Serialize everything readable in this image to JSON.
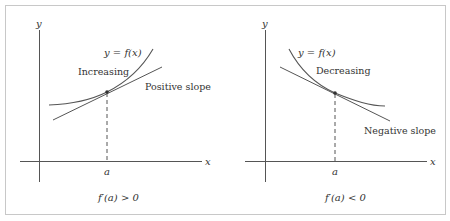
{
  "figure": {
    "left_panel": {
      "y_axis_label": "y",
      "x_axis_label": "x",
      "curve_label": "y = f(x)",
      "trend_label": "Increasing",
      "tangent_label": "Positive slope",
      "point_label": "a",
      "caption": "f′(a) > 0"
    },
    "right_panel": {
      "y_axis_label": "y",
      "x_axis_label": "x",
      "curve_label": "y = f(x)",
      "trend_label": "Decreasing",
      "tangent_label": "Negative slope",
      "point_label": "a",
      "caption": "f′(a) < 0"
    },
    "colors": {
      "line": "#444444",
      "text": "#333333",
      "border": "#c8c8c8"
    }
  }
}
